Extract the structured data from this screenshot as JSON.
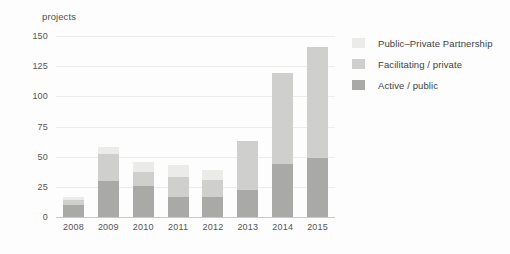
{
  "chart_data": {
    "type": "bar",
    "stacked": true,
    "title": "",
    "xlabel": "",
    "ylabel": "projects",
    "ylim": [
      0,
      150
    ],
    "yticks": [
      0,
      25,
      50,
      75,
      100,
      125,
      150
    ],
    "grid": true,
    "legend_position": "right",
    "categories": [
      "2008",
      "2009",
      "2010",
      "2011",
      "2012",
      "2013",
      "2014",
      "2015"
    ],
    "series": [
      {
        "name": "Active / public",
        "color": "#a9a9a7",
        "values": [
          10,
          30,
          26,
          17,
          17,
          22,
          44,
          49
        ]
      },
      {
        "name": "Facilitating / private",
        "color": "#cfcfcd",
        "values": [
          4,
          22,
          11,
          16,
          14,
          41,
          75,
          92
        ]
      },
      {
        "name": "Public–Private Partnership",
        "color": "#ebebe9",
        "values": [
          3,
          6,
          9,
          10,
          8,
          0,
          0,
          0
        ]
      }
    ],
    "totals": [
      17,
      58,
      46,
      43,
      39,
      63,
      119,
      141
    ]
  },
  "legend": {
    "items": [
      {
        "label": "Public–Private Partnership",
        "color": "#ebebe9"
      },
      {
        "label": "Facilitating / private",
        "color": "#cfcfcd"
      },
      {
        "label": "Active / public",
        "color": "#a9a9a7"
      }
    ]
  }
}
